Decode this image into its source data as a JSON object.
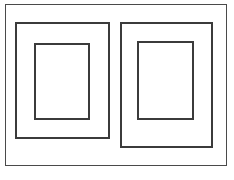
{
  "canvas": {
    "width": 234,
    "height": 180,
    "background_color": "#ffffff",
    "title": "Two nested rectangular frames line drawing"
  },
  "style": {
    "stroke_color": "#4a4a4a",
    "stroke_color_dark": "#3b3b3b",
    "fill_color": "none",
    "outer_stroke_width": 1.4,
    "middle_stroke_width": 1.8,
    "inner_stroke_width": 1.8
  },
  "diagram": {
    "type": "line-drawing",
    "shapes": [
      {
        "id": "outer-border",
        "name": "outer-border-rect",
        "label": "Outer border",
        "x": 5,
        "y": 4,
        "width": 222,
        "height": 162,
        "stroke": "#4a4a4a",
        "stroke_width": 1.4,
        "fill": "none"
      },
      {
        "id": "left-frame-outer",
        "name": "left-frame-outer-rect",
        "label": "Left frame outer",
        "x": 15,
        "y": 22,
        "width": 95,
        "height": 117,
        "stroke": "#3b3b3b",
        "stroke_width": 1.8,
        "fill": "none"
      },
      {
        "id": "left-frame-inner",
        "name": "left-frame-inner-rect",
        "label": "Left frame inner",
        "x": 34,
        "y": 43,
        "width": 56,
        "height": 77,
        "stroke": "#3b3b3b",
        "stroke_width": 1.8,
        "fill": "none"
      },
      {
        "id": "right-frame-outer",
        "name": "right-frame-outer-rect",
        "label": "Right frame outer",
        "x": 120,
        "y": 22,
        "width": 93,
        "height": 126,
        "stroke": "#3b3b3b",
        "stroke_width": 1.8,
        "fill": "none"
      },
      {
        "id": "right-frame-inner",
        "name": "right-frame-inner-rect",
        "label": "Right frame inner",
        "x": 137,
        "y": 41,
        "width": 57,
        "height": 79,
        "stroke": "#3b3b3b",
        "stroke_width": 1.8,
        "fill": "none"
      }
    ]
  }
}
